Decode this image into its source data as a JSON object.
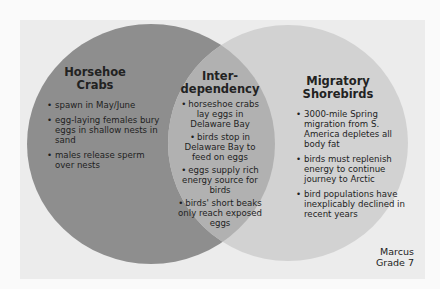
{
  "diagram": {
    "type": "venn",
    "colors": {
      "background": "#fafafa",
      "paper": "#ececec",
      "left_circle": "#8e8e8e",
      "right_circle": "#d2d2d2",
      "overlap": "#b1b1b1",
      "text": "#1e1e1e"
    },
    "left": {
      "title_line1": "Horsehoe",
      "title_line2": "Crabs",
      "items": [
        "spawn in May/June",
        "egg-laying females bury eggs in shallow nests in sand",
        "males release sperm over nests"
      ]
    },
    "middle": {
      "title_line1": "Inter-",
      "title_line2": "dependency",
      "items": [
        "horseshoe crabs lay eggs in Delaware Bay",
        "birds stop in Delaware Bay to feed on eggs",
        "eggs supply rich energy source for birds",
        "birds' short beaks only reach exposed eggs"
      ]
    },
    "right": {
      "title_line1": "Migratory",
      "title_line2": "Shorebirds",
      "items": [
        "3000-mile Spring migration from S. America depletes all body fat",
        "birds must replenish energy to continue journey to Arctic",
        "bird populations have inexplicably declined in recent years"
      ]
    },
    "signature": {
      "name": "Marcus",
      "grade": "Grade 7"
    }
  }
}
